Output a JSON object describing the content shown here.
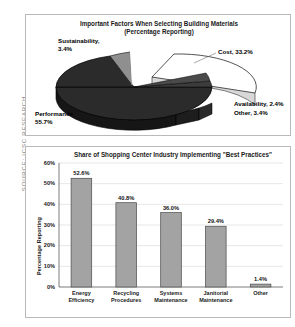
{
  "source_credit": "SOURCE: ICSC RESEARCH",
  "pie_panel": {
    "title_line1": "Important Factors When Selecting Building Materials",
    "title_line2": "(Percentage Reporting)",
    "labels": {
      "sustainability_line1": "Sustainability,",
      "sustainability_line2": "3.4%",
      "cost": "Cost, 33.2%",
      "availability": "Availability, 2.4%",
      "other": "Other, 3.4%",
      "performance_line1": "Performance",
      "performance_line2": "55.7%"
    }
  },
  "bar_panel": {
    "title": "Share of Shopping Center Industry Implementing \"Best Practices\"",
    "ylabel": "Percentage Reporting"
  },
  "colors": {
    "panel_border": "#b9b9b9",
    "bar_fill": "#a3a3a3",
    "bar_stroke": "#4a4a4a",
    "pie_dark": "#2b2b2b",
    "pie_light": "#ffffff",
    "pie_gray": "#8f8f8f",
    "gridline": "#cfcfcf",
    "text": "#000000",
    "source_text": "#8a8a8a"
  },
  "chart_data": [
    {
      "type": "pie",
      "title": "Important Factors When Selecting Building Materials (Percentage Reporting)",
      "xlabel": "",
      "ylabel": "",
      "legend_position": "none",
      "grid": false,
      "exploded_slices": [
        "Cost"
      ],
      "categories": [
        "Performance",
        "Cost",
        "Sustainability",
        "Other",
        "Availability"
      ],
      "values": [
        55.7,
        33.2,
        3.4,
        3.4,
        2.4
      ],
      "labels": [
        "Performance 55.7%",
        "Cost, 33.2%",
        "Sustainability, 3.4%",
        "Other, 3.4%",
        "Availability, 2.4%"
      ],
      "slice_colors": [
        "#2b2b2b",
        "#ffffff",
        "#8f8f8f",
        "#3a3a3a",
        "#4a4a4a"
      ]
    },
    {
      "type": "bar",
      "title": "Share of Shopping Center Industry Implementing \"Best Practices\"",
      "xlabel": "",
      "ylabel": "Percentage Reporting",
      "ylim": [
        0,
        60
      ],
      "ytick_labels": [
        "0%",
        "10%",
        "20%",
        "30%",
        "40%",
        "50%",
        "60%"
      ],
      "ytick_values": [
        0,
        10,
        20,
        30,
        40,
        50,
        60
      ],
      "grid": true,
      "legend_position": "none",
      "categories": [
        "Energy Efficiency",
        "Recycling Procedures",
        "Systems Maintenance",
        "Janitorial Maintenance",
        "Other"
      ],
      "category_lines": [
        [
          "Energy",
          "Efficiency"
        ],
        [
          "Recycling",
          "Procedures"
        ],
        [
          "Systems",
          "Maintenance"
        ],
        [
          "Janitorial",
          "Maintenance"
        ],
        [
          "Other",
          ""
        ]
      ],
      "values": [
        52.6,
        40.8,
        36.0,
        29.4,
        1.4
      ],
      "value_labels": [
        "52.6%",
        "40.8%",
        "36.0%",
        "29.4%",
        "1.4%"
      ]
    }
  ]
}
